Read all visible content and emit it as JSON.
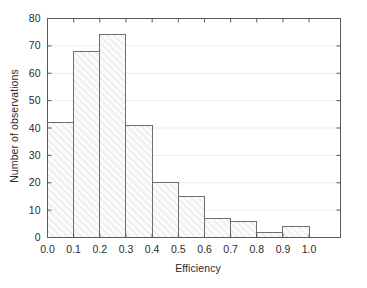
{
  "chart_data": {
    "type": "bar",
    "title": "",
    "xlabel": "Efficiency",
    "ylabel": "Number of observations",
    "categories": [
      "0.0-0.1",
      "0.1-0.2",
      "0.2-0.3",
      "0.3-0.4",
      "0.4-0.5",
      "0.5-0.6",
      "0.6-0.7",
      "0.7-0.8",
      "0.8-0.9",
      "0.9-1.0"
    ],
    "bin_edges": [
      0.0,
      0.1,
      0.2,
      0.3,
      0.4,
      0.5,
      0.6,
      0.7,
      0.8,
      0.9,
      1.0
    ],
    "values": [
      42,
      68,
      74,
      41,
      20,
      15,
      7,
      6,
      2,
      4
    ],
    "xlim": [
      0.0,
      1.12
    ],
    "ylim": [
      0,
      80
    ],
    "xticks": [
      0.0,
      0.1,
      0.2,
      0.3,
      0.4,
      0.5,
      0.6,
      0.7,
      0.8,
      0.9,
      1.0
    ],
    "xtick_labels": [
      "0.0",
      "0.1",
      "0.2",
      "0.3",
      "0.4",
      "0.5",
      "0.6",
      "0.7",
      "0.8",
      "0.9",
      "1.0"
    ],
    "yticks": [
      0,
      10,
      20,
      30,
      40,
      50,
      60,
      70,
      80
    ],
    "ytick_labels": [
      "0",
      "10",
      "20",
      "30",
      "40",
      "50",
      "60",
      "70",
      "80"
    ],
    "grid": {
      "horizontal": true,
      "vertical": false,
      "color": "#ececec"
    },
    "bar_style": {
      "fill": "#fbfbfb",
      "edge_color": "#6e6e6e",
      "hatch": "diagonal-forward",
      "hatch_color": "#cccccc"
    },
    "axis_color": "#5a5a5a",
    "legend": null
  }
}
